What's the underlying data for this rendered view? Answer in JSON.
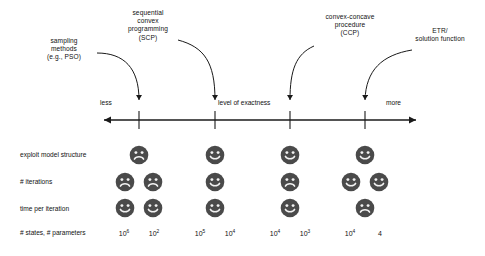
{
  "figure": {
    "type": "diagram",
    "axis": {
      "title": "level of exactness",
      "left_label": "less",
      "right_label": "more",
      "arrow_both_ends": true,
      "tick_count": 4
    },
    "annotations": [
      {
        "id": "sampling",
        "text": "sampling\nmethods\n(e.g., PSO)",
        "points_to_column": 0
      },
      {
        "id": "scp",
        "text": "sequential\nconvex\nprogramming\n(SCP)",
        "points_to_column": 1
      },
      {
        "id": "ccp",
        "text": "convex-concave\nprocedure\n(CCP)",
        "points_to_column": 2
      },
      {
        "id": "etr",
        "text": "ETR/\nsolution function",
        "points_to_column": 3
      }
    ],
    "rows": [
      {
        "label": "exploit model structure"
      },
      {
        "label": "# iterations"
      },
      {
        "label": "time per iteration"
      },
      {
        "label": "# states, # parameters"
      }
    ],
    "columns": [
      {
        "method": "sampling methods (e.g., PSO)",
        "faces": [
          {
            "count": 1,
            "mood": "sad"
          },
          {
            "count": 2,
            "mood": "sad"
          },
          {
            "count": 2,
            "mood": "happy"
          }
        ],
        "params": [
          "10^6",
          "10^2"
        ],
        "params_html": [
          "10<sup>6</sup>",
          "10<sup>2</sup>"
        ]
      },
      {
        "method": "sequential convex programming (SCP)",
        "faces": [
          {
            "count": 1,
            "mood": "happy"
          },
          {
            "count": 1,
            "mood": "happy"
          },
          {
            "count": 1,
            "mood": "happy"
          }
        ],
        "params": [
          "10^5",
          "10^4"
        ],
        "params_html": [
          "10<sup>5</sup>",
          "10<sup>4</sup>"
        ]
      },
      {
        "method": "convex-concave procedure (CCP)",
        "faces": [
          {
            "count": 1,
            "mood": "happy"
          },
          {
            "count": 1,
            "mood": "sad"
          },
          {
            "count": 1,
            "mood": "happy"
          }
        ],
        "params": [
          "10^4",
          "10^3"
        ],
        "params_html": [
          "10<sup>4</sup>",
          "10<sup>3</sup>"
        ]
      },
      {
        "method": "ETR/solution function",
        "faces": [
          {
            "count": 1,
            "mood": "happy"
          },
          {
            "count": 2,
            "mood": "happy"
          },
          {
            "count": 1,
            "mood": "sad"
          }
        ],
        "params": [
          "10^4",
          "4"
        ],
        "params_html": [
          "10<sup>4</sup>",
          "4"
        ]
      }
    ],
    "colors": {
      "face_fill": "#4a4a4a",
      "face_feature": "#f2f2f2",
      "line": "#1a1a1a",
      "background": "#ffffff"
    },
    "layout": {
      "axis_y": 120,
      "axis_x_start": 98,
      "axis_x_end": 420,
      "tick_x": [
        139,
        215,
        290,
        365
      ],
      "row_y": [
        155,
        182,
        208
      ],
      "param_y": 230
    }
  }
}
